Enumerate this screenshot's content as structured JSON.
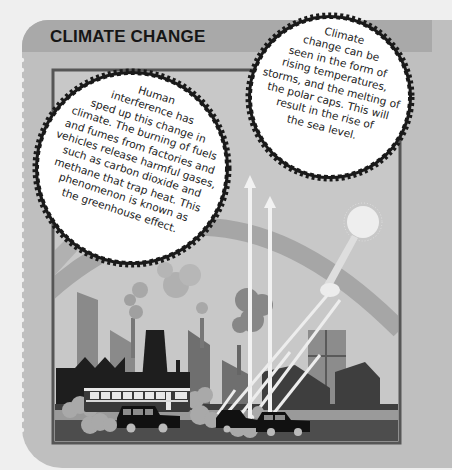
{
  "page": {
    "title": "CLIMATE CHANGE",
    "theme": {
      "page_bg": "#efefef",
      "panel_bg": "#bfbfbf",
      "header_bg": "#a9a9a9",
      "frame_border": "#555555",
      "sky": "#c9c9c9",
      "dark_silhouette": "#1e1e1e",
      "mid_building": "#7a7a7a",
      "bubble_fill": "#ffffff",
      "bubble_edge": "#1a1a1a"
    }
  },
  "bubbles": {
    "left": {
      "lines": [
        "Human",
        "interference has",
        "sped up this change in",
        "climate. The burning of fuels",
        "and fumes from factories and",
        "vehicles release harmful gases,",
        "such as carbon dioxide and",
        "methane that trap heat. This",
        "phenomenon is known as",
        "the greenhouse effect."
      ]
    },
    "right": {
      "lines": [
        "Climate",
        "change can be",
        "seen in the form of",
        "rising temperatures,",
        "storms, and the melting of",
        "the polar caps. This will",
        "result in the rise of",
        "the sea level."
      ]
    }
  },
  "illustration": {
    "elements": [
      "rainbow-arc",
      "sun",
      "heat-arrows",
      "factories",
      "smoke",
      "houses",
      "bus",
      "cars",
      "exhaust-clouds",
      "road"
    ]
  }
}
